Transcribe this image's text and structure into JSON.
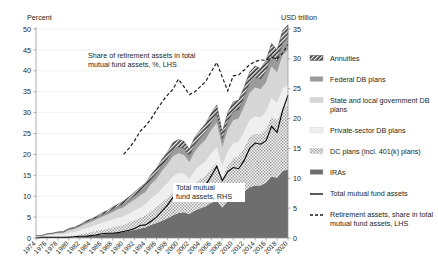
{
  "chart_data": {
    "type": "area",
    "title": "",
    "subtitle": "",
    "ylabel": "Percent",
    "y2label": "USD trillion",
    "xlabel": "",
    "ylim": [
      0,
      50
    ],
    "y2lim": [
      0,
      35
    ],
    "ytick_step": 5,
    "y2tick_step": 5,
    "yticks": [
      0,
      5,
      10,
      15,
      20,
      25,
      30,
      35,
      40,
      45,
      50
    ],
    "y2ticks": [
      0,
      5,
      10,
      15,
      20,
      25,
      30,
      35
    ],
    "grid": true,
    "legend_position": "right",
    "x": [
      1974,
      1975,
      1976,
      1977,
      1978,
      1979,
      1980,
      1981,
      1982,
      1983,
      1984,
      1985,
      1986,
      1987,
      1988,
      1989,
      1990,
      1991,
      1992,
      1993,
      1994,
      1995,
      1996,
      1997,
      1998,
      1999,
      2000,
      2001,
      2002,
      2003,
      2004,
      2005,
      2006,
      2007,
      2008,
      2009,
      2010,
      2011,
      2012,
      2013,
      2014,
      2015,
      2016,
      2017,
      2018,
      2019,
      2020
    ],
    "xtick_labels": [
      "1974",
      "1976",
      "1978",
      "1980",
      "1982",
      "1984",
      "1986",
      "1988",
      "1990",
      "1992",
      "1994",
      "1996",
      "1998",
      "2000",
      "2002",
      "2004",
      "2006",
      "2008",
      "2010",
      "2012",
      "2014",
      "2016",
      "2018",
      "2020"
    ],
    "stack_axis": "right",
    "series": [
      {
        "name": "IRAs",
        "axis": "right",
        "style": "solid-dark",
        "color": "#6e6e6e",
        "values": [
          0.0,
          0.0,
          0.0,
          0.0,
          0.0,
          0.0,
          0.1,
          0.1,
          0.2,
          0.3,
          0.4,
          0.5,
          0.6,
          0.7,
          0.8,
          0.9,
          1.0,
          1.2,
          1.4,
          1.6,
          1.8,
          2.2,
          2.5,
          2.9,
          3.3,
          3.8,
          4.2,
          4.3,
          4.0,
          4.6,
          5.0,
          5.3,
          5.9,
          6.3,
          5.1,
          6.2,
          6.8,
          7.0,
          7.8,
          8.5,
          8.8,
          8.8,
          9.3,
          10.3,
          10.1,
          11.2,
          11.5
        ]
      },
      {
        "name": "DC plans (incl. 401(k) plans)",
        "axis": "right",
        "style": "dotted",
        "color": "#b9b9b9",
        "values": [
          0.1,
          0.1,
          0.1,
          0.2,
          0.2,
          0.2,
          0.3,
          0.3,
          0.4,
          0.5,
          0.6,
          0.7,
          0.8,
          0.9,
          1.0,
          1.1,
          1.2,
          1.4,
          1.6,
          1.8,
          2.0,
          2.4,
          2.7,
          3.1,
          3.5,
          4.0,
          4.3,
          4.3,
          3.9,
          4.5,
          4.9,
          5.2,
          5.8,
          6.3,
          4.9,
          6.0,
          6.6,
          6.7,
          7.4,
          8.4,
          8.7,
          8.6,
          9.0,
          10.0,
          9.6,
          10.6,
          10.9
        ]
      },
      {
        "name": "Private-sector DB plans",
        "axis": "right",
        "style": "solid-lightest",
        "color": "#efefef",
        "values": [
          0.2,
          0.2,
          0.3,
          0.3,
          0.4,
          0.4,
          0.5,
          0.6,
          0.7,
          0.8,
          0.9,
          1.0,
          1.1,
          1.2,
          1.3,
          1.4,
          1.4,
          1.5,
          1.6,
          1.7,
          1.8,
          2.0,
          2.1,
          2.3,
          2.4,
          2.5,
          2.4,
          2.2,
          2.0,
          2.2,
          2.3,
          2.4,
          2.5,
          2.6,
          2.0,
          2.3,
          2.4,
          2.4,
          2.6,
          2.8,
          2.9,
          2.8,
          2.9,
          3.1,
          2.9,
          3.2,
          3.3
        ]
      },
      {
        "name": "State and local government DB plans",
        "axis": "right",
        "style": "solid-light",
        "color": "#d6d6d6",
        "values": [
          0.1,
          0.1,
          0.2,
          0.2,
          0.3,
          0.3,
          0.4,
          0.5,
          0.6,
          0.7,
          0.8,
          0.9,
          1.0,
          1.1,
          1.2,
          1.4,
          1.5,
          1.7,
          1.8,
          2.0,
          2.1,
          2.4,
          2.6,
          2.9,
          3.1,
          3.4,
          3.3,
          3.1,
          2.8,
          3.2,
          3.4,
          3.6,
          3.9,
          4.1,
          3.2,
          3.6,
          3.9,
          3.9,
          4.2,
          4.6,
          4.8,
          4.7,
          4.9,
          5.3,
          5.1,
          5.6,
          5.8
        ]
      },
      {
        "name": "Federal DB plans",
        "axis": "right",
        "style": "solid-mid",
        "color": "#9b9b9b",
        "values": [
          0.0,
          0.0,
          0.1,
          0.1,
          0.1,
          0.1,
          0.2,
          0.2,
          0.2,
          0.3,
          0.3,
          0.3,
          0.4,
          0.4,
          0.5,
          0.5,
          0.6,
          0.6,
          0.7,
          0.7,
          0.8,
          0.8,
          0.9,
          1.0,
          1.0,
          1.1,
          1.1,
          1.1,
          1.1,
          1.2,
          1.2,
          1.3,
          1.3,
          1.4,
          1.3,
          1.4,
          1.5,
          1.5,
          1.6,
          1.7,
          1.7,
          1.7,
          1.8,
          1.9,
          1.9,
          2.0,
          2.1
        ]
      },
      {
        "name": "Annuities",
        "axis": "right",
        "style": "hatched-dark",
        "color": "#3a3a3a",
        "values": [
          0.0,
          0.0,
          0.0,
          0.0,
          0.0,
          0.1,
          0.1,
          0.1,
          0.1,
          0.2,
          0.2,
          0.2,
          0.3,
          0.3,
          0.4,
          0.4,
          0.5,
          0.5,
          0.6,
          0.7,
          0.7,
          0.8,
          0.9,
          1.0,
          1.1,
          1.2,
          1.2,
          1.2,
          1.1,
          1.2,
          1.3,
          1.4,
          1.5,
          1.6,
          1.3,
          1.5,
          1.6,
          1.6,
          1.7,
          1.8,
          1.9,
          1.8,
          1.9,
          2.0,
          1.9,
          2.1,
          2.1
        ]
      }
    ],
    "lines": [
      {
        "name": "Total mutual fund assets",
        "axis": "right",
        "style": "solid",
        "color": "#000000",
        "values": [
          0.0,
          0.1,
          0.1,
          0.1,
          0.1,
          0.1,
          0.1,
          0.2,
          0.3,
          0.3,
          0.4,
          0.5,
          0.7,
          0.8,
          0.8,
          0.9,
          1.1,
          1.3,
          1.6,
          2.1,
          2.2,
          2.8,
          3.5,
          4.5,
          5.5,
          6.8,
          6.9,
          6.9,
          6.4,
          7.4,
          8.1,
          8.9,
          10.4,
          12.0,
          9.6,
          11.1,
          11.8,
          11.6,
          13.0,
          15.0,
          15.9,
          15.7,
          16.3,
          18.7,
          17.7,
          21.3,
          23.9
        ]
      },
      {
        "name": "Retirement assets, share in total mutual fund assets, LHS",
        "axis": "left",
        "style": "dashed",
        "color": "#1a1a1a",
        "x_start": 1990,
        "values": [
          20.0,
          21.5,
          23.3,
          25.5,
          26.8,
          28.5,
          30.6,
          32.5,
          34.2,
          35.6,
          38.0,
          36.2,
          34.3,
          35.0,
          36.2,
          37.5,
          39.8,
          42.0,
          38.5,
          35.2,
          38.8,
          39.0,
          40.2,
          41.5,
          42.2,
          42.6,
          42.5,
          43.2,
          42.8,
          44.2,
          46.3
        ]
      }
    ],
    "annotations": [
      {
        "id": "share-annotation",
        "text_line1": "Share of retirement assets in total",
        "text_line2": "mutual fund assets, %, LHS"
      },
      {
        "id": "total-annotation",
        "text_line1": "Total mutual",
        "text_line2": "fund assets, RHS"
      }
    ],
    "legend": [
      {
        "label": "Annuities",
        "swatch": "hatched-dark"
      },
      {
        "label": "Federal DB plans",
        "swatch": "solid-mid"
      },
      {
        "label": "State and local government DB",
        "label2": "plans",
        "swatch": "solid-light"
      },
      {
        "label": "Private-sector DB plans",
        "swatch": "solid-lightest"
      },
      {
        "label": "DC plans (incl. 401(k) plans)",
        "swatch": "dotted"
      },
      {
        "label": "IRAs",
        "swatch": "solid-dark"
      },
      {
        "label": "Total mutual fund assets",
        "swatch": "line-solid"
      },
      {
        "label": "Retirement assets, share in total",
        "label2": "mutual fund assets, LHS",
        "swatch": "line-dashed"
      }
    ]
  }
}
